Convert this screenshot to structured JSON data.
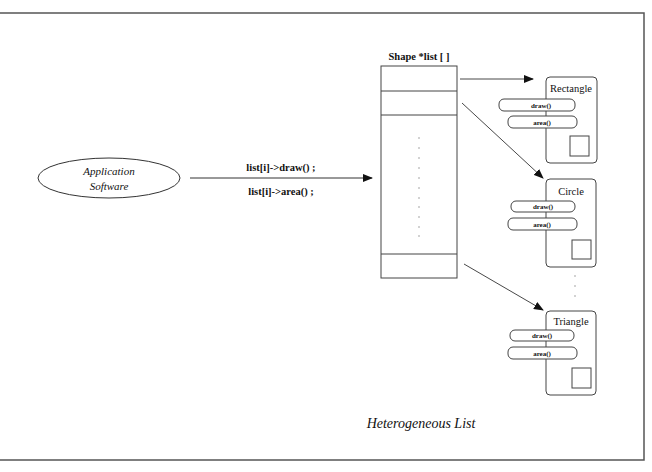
{
  "diagram": {
    "caption": "Heterogeneous List",
    "client": {
      "label_line1": "Application",
      "label_line2": "Software"
    },
    "calls": {
      "line1": "list[i]->draw() ;",
      "line2": "list[i]->area() ;"
    },
    "array": {
      "title": "Shape *list [ ]",
      "slot_count_visible": 3
    },
    "objects": [
      {
        "name": "Rectangle",
        "methods": [
          "draw()",
          "area()"
        ]
      },
      {
        "name": "Circle",
        "methods": [
          "draw()",
          "area()"
        ]
      },
      {
        "name": "Triangle",
        "methods": [
          "draw()",
          "area()"
        ]
      }
    ],
    "colors": {
      "stroke": "#333333",
      "frame": "#555555",
      "dots": "#999999",
      "background": "#ffffff"
    }
  }
}
